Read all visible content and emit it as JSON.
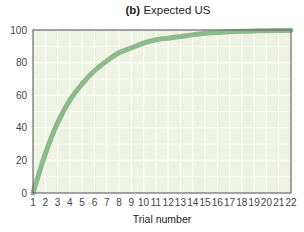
{
  "title": {
    "tag": "(b)",
    "text": "Expected US"
  },
  "colors": {
    "plot_background": "#eef2e3",
    "grid": "#fbfcf6",
    "frame": "#6a6a6a",
    "curve": "#8dba8b",
    "text": "#444444"
  },
  "chart_data": {
    "type": "line",
    "title": "(b) Expected US",
    "xlabel": "Trial number",
    "ylabel": "",
    "x": [
      1,
      2,
      3,
      4,
      5,
      6,
      7,
      8,
      9,
      10,
      11,
      12,
      13,
      14,
      15,
      16,
      17,
      18,
      19,
      20,
      21,
      22
    ],
    "series": [
      {
        "name": "Expected US",
        "values": [
          0,
          24,
          43,
          57,
          67,
          75,
          81,
          86,
          89,
          92,
          94,
          95,
          96,
          97,
          98,
          98.5,
          99,
          99.2,
          99.4,
          99.6,
          99.7,
          99.8
        ]
      }
    ],
    "xticks": [
      "1",
      "2",
      "3",
      "4",
      "5",
      "6",
      "7",
      "8",
      "9",
      "10",
      "11",
      "12",
      "13",
      "14",
      "15",
      "16",
      "17",
      "18",
      "19",
      "20",
      "21",
      "22"
    ],
    "yticks": [
      "0",
      "20",
      "40",
      "60",
      "80",
      "100"
    ],
    "xlim": [
      1,
      22
    ],
    "ylim": [
      0,
      100
    ],
    "grid": true,
    "legend": "none"
  }
}
